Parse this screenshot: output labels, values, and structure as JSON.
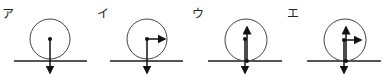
{
  "panels": [
    {
      "label": "ア",
      "forces": [
        "gravity-down-from-center"
      ]
    },
    {
      "label": "イ",
      "forces": [
        "gravity-down-from-center",
        "horizontal-right-from-center"
      ]
    },
    {
      "label": "ウ",
      "forces": [
        "gravity-down-from-center",
        "normal-up-from-contact"
      ]
    },
    {
      "label": "エ",
      "forces": [
        "gravity-down-from-center",
        "normal-up-from-contact",
        "horizontal-right-from-center"
      ]
    }
  ],
  "colors": {
    "line": "#111111",
    "ground": "#555555",
    "circle": "#444444"
  }
}
